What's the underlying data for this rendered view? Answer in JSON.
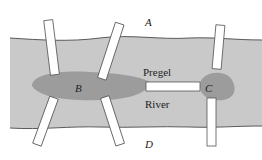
{
  "diagram": {
    "labels": {
      "land_north": "A",
      "island_west": "B",
      "island_east": "C",
      "land_south": "D",
      "river_word1": "Pregel",
      "river_word2": "River"
    },
    "colors": {
      "background": "#ffffff",
      "river": "#c9c9c9",
      "island": "#9c9c9c",
      "bridge_fill": "#ffffff",
      "bridge_stroke": "#555555",
      "bank_line": "#5a5a5a"
    },
    "bridge_count": 7
  }
}
